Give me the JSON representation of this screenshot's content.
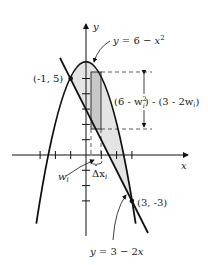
{
  "figure": {
    "type": "area-between-curves",
    "axes": {
      "x_label": "x",
      "y_label": "y",
      "origin_px": [
        86,
        155
      ],
      "unit_px": 15.3,
      "x_ticks": [
        -3,
        -2,
        -1,
        1,
        2,
        3
      ],
      "y_ticks": [
        -3,
        -2,
        -1,
        1,
        2,
        3,
        4,
        5
      ]
    },
    "curves": [
      {
        "name": "parabola",
        "equation_label": "y = 6 - x",
        "exponent": "2",
        "color": "#111111"
      },
      {
        "name": "line",
        "equation_label": "y = 3 - 2x",
        "color": "#111111"
      }
    ],
    "intersections": [
      {
        "label": "(-1, 5)",
        "x": -1,
        "y": 5
      },
      {
        "label": "(3, -3)",
        "x": 3,
        "y": -3
      }
    ],
    "shaded_region": {
      "fill": "#e4e4e4"
    },
    "rectangle": {
      "fill": "#c8c8c8",
      "height_label_a": "(6 - w",
      "height_label_sub": "i",
      "height_label_sup": "2",
      "height_label_b": ") - (3 - 2w",
      "height_label_c": ")"
    },
    "annotations": {
      "w_label": "w",
      "w_sub": "i",
      "dx_label": "Δx",
      "dx_sub": "i"
    }
  }
}
